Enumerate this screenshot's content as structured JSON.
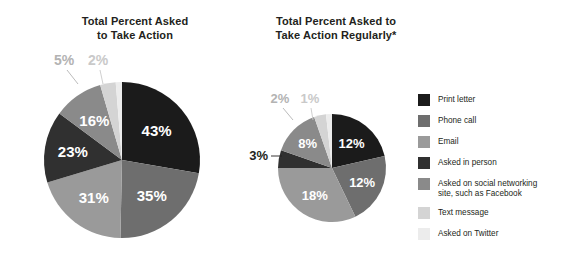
{
  "chart_data": [
    {
      "type": "pie",
      "id": "total-percent-asked",
      "title": "Total Percent Asked\nto Take Action",
      "title_line1": "Total Percent Asked",
      "title_line2": "to Take Action",
      "categories": [
        "Print letter",
        "Phone call",
        "Email",
        "Asked in person",
        "Asked on social networking site, such as Facebook",
        "Text message",
        "Asked on Twitter"
      ],
      "values": [
        43,
        35,
        31,
        23,
        16,
        5,
        2
      ],
      "value_labels": [
        "43%",
        "35%",
        "31%",
        "23%",
        "16%",
        "5%",
        "2%"
      ],
      "colors": [
        "#1b1b1b",
        "#6e6e6e",
        "#9a9a9a",
        "#303030",
        "#8a8a8a",
        "#d4d4d4",
        "#ececec"
      ],
      "label_colors": [
        "#ffffff",
        "#ffffff",
        "#ffffff",
        "#ffffff",
        "#ffffff",
        "#b3b3b3",
        "#c9c9c9"
      ],
      "callouts": [
        "5%",
        "2%"
      ],
      "legend_position": "right",
      "grid": false
    },
    {
      "type": "pie",
      "id": "total-percent-asked-regularly",
      "title": "Total Percent Asked to\nTake Action Regularly*",
      "title_line1": "Total Percent Asked to",
      "title_line2": "Take Action Regularly*",
      "categories": [
        "Print letter",
        "Phone call",
        "Email",
        "Asked in person",
        "Asked on social networking site, such as Facebook",
        "Text message",
        "Asked on Twitter"
      ],
      "values": [
        12,
        12,
        18,
        3,
        8,
        2,
        1
      ],
      "value_labels": [
        "12%",
        "12%",
        "18%",
        "3%",
        "8%",
        "2%",
        "1%"
      ],
      "colors": [
        "#1b1b1b",
        "#6e6e6e",
        "#9a9a9a",
        "#303030",
        "#8a8a8a",
        "#d4d4d4",
        "#ececec"
      ],
      "label_colors": [
        "#ffffff",
        "#ffffff",
        "#ffffff",
        "#231f20",
        "#ffffff",
        "#b3b3b3",
        "#c9c9c9"
      ],
      "callouts": [
        "3%",
        "2%",
        "1%"
      ],
      "legend_position": "right",
      "grid": false
    }
  ],
  "legend": {
    "items": [
      {
        "label": "Print letter",
        "color": "#1b1b1b"
      },
      {
        "label": "Phone call",
        "color": "#6e6e6e"
      },
      {
        "label": "Email",
        "color": "#9a9a9a"
      },
      {
        "label": "Asked in person",
        "color": "#303030"
      },
      {
        "label": "Asked on social networking\nsite, such as Facebook",
        "color": "#8a8a8a"
      },
      {
        "label": "Text message",
        "color": "#d4d4d4"
      },
      {
        "label": "Asked on Twitter",
        "color": "#ececec"
      }
    ]
  },
  "colors": {
    "background": "#ffffff",
    "text": "#231f20",
    "light_label": "#b3b3b3"
  }
}
